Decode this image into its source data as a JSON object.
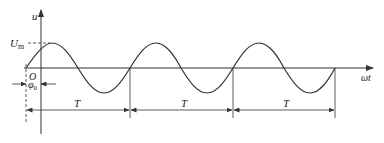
{
  "diagram": {
    "type": "sinusoid-waveform",
    "labels": {
      "y_axis": "u",
      "x_axis": "ωt",
      "amplitude": "U",
      "amplitude_sub": "m",
      "origin": "O",
      "phase": "φ",
      "phase_sub": "0",
      "period_1": "T",
      "period_2": "T",
      "period_3": "T"
    },
    "periods_shown": 3,
    "stroke_color": "#333333"
  }
}
